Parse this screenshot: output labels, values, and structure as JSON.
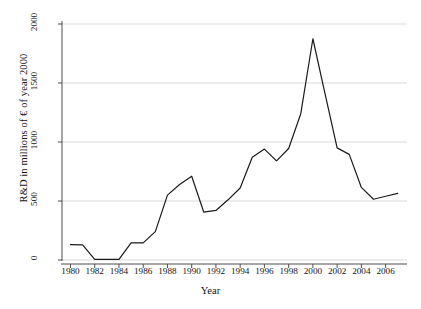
{
  "chart_data": {
    "type": "line",
    "title": "",
    "subtitle": "",
    "xlabel": "Year",
    "ylabel": "R&D in millions of € of year 2000",
    "xlim": [
      1979.3,
      2007.6
    ],
    "ylim": [
      0,
      2100
    ],
    "grid": true,
    "grid_axis": "y",
    "legend": "none",
    "line_color": "#1a1a1a",
    "grid_color": "#d9d9d9",
    "axis_color": "#4d4d4d",
    "background": "#ffffff",
    "xticks": [
      1980,
      1982,
      1984,
      1986,
      1988,
      1990,
      1992,
      1994,
      1996,
      1998,
      2000,
      2002,
      2004,
      2006
    ],
    "xtick_labels": [
      "1980",
      "1982",
      "1984",
      "1986",
      "1988",
      "1990",
      "1992",
      "1994",
      "1996",
      "1998",
      "2000",
      "2002",
      "2004",
      "2006"
    ],
    "yticks": [
      0,
      500,
      1000,
      1500,
      2000
    ],
    "ytick_labels": [
      "0",
      "500",
      "1000",
      "1500",
      "2000"
    ],
    "x": [
      1980,
      1981,
      1982,
      1983,
      1984,
      1985,
      1986,
      1987,
      1988,
      1989,
      1990,
      1991,
      1992,
      1993,
      1994,
      1995,
      1996,
      1997,
      1998,
      1999,
      2000,
      2001,
      2002,
      2003,
      2004,
      2005,
      2006,
      2007
    ],
    "values": [
      130,
      128,
      5,
      5,
      5,
      145,
      145,
      240,
      550,
      640,
      710,
      405,
      420,
      510,
      610,
      870,
      940,
      840,
      945,
      1240,
      1875,
      1410,
      950,
      895,
      615,
      515,
      540,
      565
    ],
    "series": [
      {
        "name": "R&D expenditure",
        "values": [
          130,
          128,
          5,
          5,
          5,
          145,
          145,
          240,
          550,
          640,
          710,
          405,
          420,
          510,
          610,
          870,
          940,
          840,
          945,
          1240,
          1875,
          1410,
          950,
          895,
          615,
          515,
          540,
          565
        ]
      }
    ]
  }
}
